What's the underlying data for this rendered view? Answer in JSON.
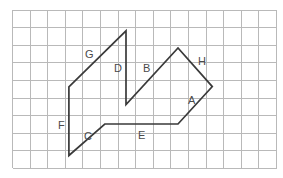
{
  "figure": {
    "background_color": "#ffffff",
    "grid": {
      "color": "#b9b9b9",
      "origin_x": 12.5,
      "origin_y": 10.0,
      "cell_size": 17.6,
      "cols": 15,
      "rows": 9,
      "visible": true
    },
    "stroke_color": "#3a3a3a",
    "stroke_width": 1.7,
    "label_color": "#4a4a4a"
  },
  "shape": {
    "name": "arrow-like-polygon",
    "closed": true,
    "vertices": [
      {
        "id": "v1",
        "x": 68.9,
        "y": 86.8
      },
      {
        "id": "v2",
        "x": 126.0,
        "y": 30.8
      },
      {
        "id": "v3",
        "x": 126.0,
        "y": 104.6
      },
      {
        "id": "v4",
        "x": 178.0,
        "y": 48.0
      },
      {
        "id": "v5",
        "x": 212.3,
        "y": 86.6
      },
      {
        "id": "v6",
        "x": 178.0,
        "y": 124.0
      },
      {
        "id": "v7",
        "x": 104.8,
        "y": 124.0
      },
      {
        "id": "v8",
        "x": 68.9,
        "y": 155.5
      }
    ],
    "path": "M 68.9 86.8 L 126.0 30.8 L 126.0 104.6 L 178.0 48.0 L 212.3 86.6 L 178.0 124.0 L 104.8 124.0 L 68.9 155.5 Z"
  },
  "segments": [
    {
      "label": "G",
      "from": "v1",
      "to": "v2",
      "label_x": 85,
      "label_y": 49
    },
    {
      "label": "D",
      "from": "v2",
      "to": "v3",
      "label_x": 114,
      "label_y": 63
    },
    {
      "label": "B",
      "from": "v3",
      "to": "v4",
      "label_x": 143,
      "label_y": 63
    },
    {
      "label": "H",
      "from": "v4",
      "to": "v5",
      "label_x": 198,
      "label_y": 56
    },
    {
      "label": "A",
      "from": "v5",
      "to": "v6",
      "label_x": 188,
      "label_y": 95
    },
    {
      "label": "E",
      "from": "v6",
      "to": "v7",
      "label_x": 138,
      "label_y": 130
    },
    {
      "label": "C",
      "from": "v7",
      "to": "v8",
      "label_x": 84,
      "label_y": 131
    },
    {
      "label": "F",
      "from": "v8",
      "to": "v1",
      "label_x": 58,
      "label_y": 120
    }
  ]
}
